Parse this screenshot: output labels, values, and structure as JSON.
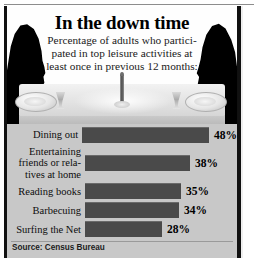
{
  "headline": "In the down time",
  "subtitle_lines": [
    "Percentage of adults who partici-",
    "pated in top leisure activities at",
    "least once in previous 12 months:"
  ],
  "illustration": {
    "left_figure": "man-silhouette",
    "right_figure": "woman-silhouette",
    "table_items": [
      "plate",
      "wine-glass",
      "candle",
      "plate",
      "wine-glass"
    ]
  },
  "source": "Source: Census Bureau",
  "chart_data": {
    "type": "bar",
    "orientation": "horizontal",
    "title": "In the down time",
    "subtitle": "Percentage of adults who participated in top leisure activities at least once in previous 12 months:",
    "categories": [
      "Dining out",
      "Entertaining friends or relatives at home",
      "Reading books",
      "Barbecuing",
      "Surfing the Net"
    ],
    "category_lines": [
      [
        "Dining out"
      ],
      [
        "Entertaining",
        "friends or rela-",
        "tives at home"
      ],
      [
        "Reading books"
      ],
      [
        "Barbecuing"
      ],
      [
        "Surfing the Net"
      ]
    ],
    "values": [
      48,
      38,
      35,
      34,
      28
    ],
    "value_labels": [
      "48%",
      "38%",
      "35%",
      "34%",
      "28%"
    ],
    "xlabel": "",
    "ylabel": "",
    "xlim": [
      0,
      48
    ],
    "grid": false,
    "legend": false,
    "bar_color": "#4a4a4a",
    "panel_color": "#c8c8c8",
    "source": "Source: Census Bureau"
  }
}
